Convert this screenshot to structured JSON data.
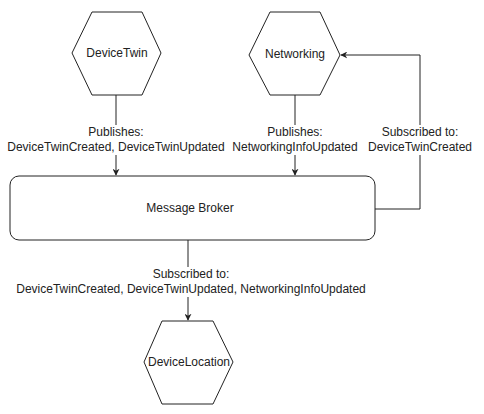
{
  "nodes": {
    "device_twin": {
      "label": "DeviceTwin"
    },
    "networking": {
      "label": "Networking"
    },
    "message_broker": {
      "label": "Message Broker"
    },
    "device_location": {
      "label": "DeviceLocation"
    }
  },
  "edges": {
    "device_twin_to_broker": {
      "line1": "Publishes:",
      "line2": "DeviceTwinCreated, DeviceTwinUpdated"
    },
    "networking_to_broker": {
      "line1": "Publishes:",
      "line2": "NetworkingInfoUpdated"
    },
    "broker_to_networking": {
      "line1": "Subscribed to:",
      "line2": "DeviceTwinCreated"
    },
    "broker_to_device_location": {
      "line1": "Subscribed to:",
      "line2": "DeviceTwinCreated, DeviceTwinUpdated, NetworkingInfoUpdated"
    }
  },
  "colors": {
    "stroke": "#222222",
    "background": "#ffffff",
    "text": "#222222"
  }
}
